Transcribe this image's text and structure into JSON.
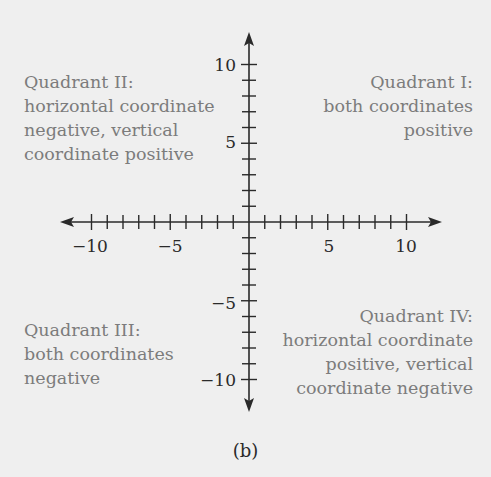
{
  "diagram": {
    "type": "coordinate-plane",
    "origin": [
      0,
      0
    ],
    "x_axis": {
      "min": -10,
      "max": 10,
      "tick_step": 1,
      "labeled_ticks": [
        -10,
        -5,
        5,
        10
      ]
    },
    "y_axis": {
      "min": -10,
      "max": 10,
      "tick_step": 1,
      "labeled_ticks": [
        10,
        5,
        -5,
        -10
      ]
    },
    "tick_labels": {
      "x_neg10": "−10",
      "x_neg5": "−5",
      "x_5": "5",
      "x_10": "10",
      "y_10": "10",
      "y_5": "5",
      "y_neg5": "−5",
      "y_neg10": "−10"
    },
    "quadrants": {
      "q1": {
        "lines": [
          "Quadrant I:",
          "both coordinates",
          "positive"
        ]
      },
      "q2": {
        "lines": [
          "Quadrant II:",
          "horizontal coordinate",
          "negative, vertical",
          "coordinate positive"
        ]
      },
      "q3": {
        "lines": [
          "Quadrant III:",
          "both coordinates",
          "negative"
        ]
      },
      "q4": {
        "lines": [
          "Quadrant IV:",
          "horizontal coordinate",
          "positive, vertical",
          "coordinate negative"
        ]
      }
    },
    "caption": "(b)",
    "colors": {
      "background": "#efefef",
      "axis": "#2a2a2a",
      "label_text": "#7c7c7c"
    }
  }
}
